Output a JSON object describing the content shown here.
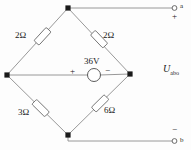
{
  "figure": {
    "type": "circuit-diagram",
    "colors": {
      "wire": "#8c8c8c",
      "node": "#1a1a1a",
      "text": "#1a1a1a",
      "background": "#fdfdfd",
      "component_fill": "#ffffff"
    }
  },
  "components": {
    "resistor_top_left": {
      "label": "2Ω",
      "value": 2,
      "unit": "Ω"
    },
    "resistor_top_right": {
      "label": "2Ω",
      "value": 2,
      "unit": "Ω"
    },
    "resistor_bottom_left": {
      "label": "3Ω",
      "value": 3,
      "unit": "Ω"
    },
    "resistor_bottom_right": {
      "label": "6Ω",
      "value": 6,
      "unit": "Ω"
    },
    "voltage_source": {
      "label": "36V",
      "value": 36,
      "unit": "V",
      "plus_sign": "+",
      "minus_sign": "−"
    }
  },
  "terminals": {
    "top": {
      "name": "a",
      "polarity": "+"
    },
    "bottom": {
      "name": "b",
      "polarity": "−"
    }
  },
  "output": {
    "label": "U",
    "subscript": "abo"
  }
}
